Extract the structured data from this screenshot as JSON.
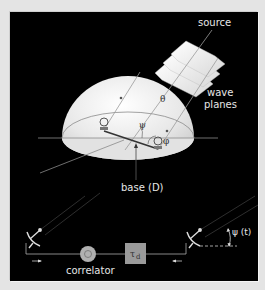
{
  "diagram": {
    "type": "radio interferometer geometry",
    "labels": {
      "source": "source",
      "wave_planes_line1": "wave",
      "wave_planes_line2": "planes",
      "theta": "θ",
      "psi": "ψ",
      "phi": "φ",
      "base": "base (D)",
      "psi_t": "ψ (t)",
      "correlator": "correlator",
      "delay": "τ",
      "delay_sub": "d"
    },
    "colors": {
      "background": "#000000",
      "frame": "#e4e4e4",
      "hemisphere": "#eeeeee",
      "line": "#8a8a8a",
      "correlator": "#b0b0b0",
      "delay_box": "#9a9a9a"
    }
  }
}
